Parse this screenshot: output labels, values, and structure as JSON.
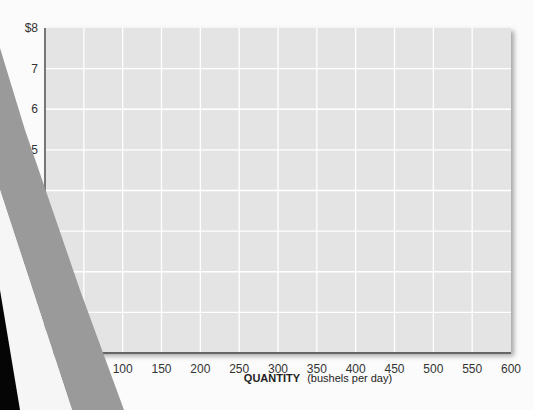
{
  "chart_data": {
    "type": "line",
    "title": "",
    "xlabel": "QUANTITY (bushels per day)",
    "xlabel_bold": "QUANTITY",
    "xlabel_unit": "(bushels per day)",
    "ylabel": "",
    "xlim": [
      0,
      600
    ],
    "ylim": [
      0,
      8
    ],
    "x_ticks": [
      100,
      150,
      200,
      250,
      300,
      350,
      400,
      450,
      500,
      550,
      600
    ],
    "x_tick_labels": [
      "100",
      "150",
      "200",
      "250",
      "300",
      "350",
      "400",
      "450",
      "500",
      "550",
      "600"
    ],
    "y_ticks": [
      8,
      7,
      6,
      5
    ],
    "y_tick_labels": [
      "$8",
      "7",
      "6",
      "5"
    ],
    "grid": true,
    "grid_x_step": 50,
    "grid_y_step": 1,
    "series": [],
    "colors": {
      "plot_background": "#e4e4e4",
      "grid": "#ffffff",
      "axis": "#777777",
      "overlay_band": "#9a9a9a",
      "dark_region": "#050505"
    }
  }
}
